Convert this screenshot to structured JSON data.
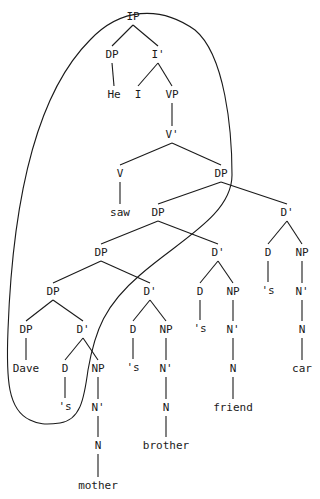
{
  "diagram": {
    "type": "syntax-tree",
    "nodes": [
      {
        "id": "n0",
        "label": "IP",
        "x": 133,
        "y": 20
      },
      {
        "id": "n1",
        "label": "DP",
        "x": 112,
        "y": 58
      },
      {
        "id": "n2",
        "label": "I'",
        "x": 158,
        "y": 58
      },
      {
        "id": "n3",
        "label": "He",
        "x": 114,
        "y": 98
      },
      {
        "id": "n4",
        "label": "I",
        "x": 138,
        "y": 98
      },
      {
        "id": "n5",
        "label": "VP",
        "x": 172,
        "y": 98
      },
      {
        "id": "n6",
        "label": "V'",
        "x": 172,
        "y": 138
      },
      {
        "id": "n7",
        "label": "V",
        "x": 120,
        "y": 177
      },
      {
        "id": "n8",
        "label": "DP",
        "x": 221,
        "y": 177
      },
      {
        "id": "n9",
        "label": "saw",
        "x": 120,
        "y": 216
      },
      {
        "id": "n10",
        "label": "DP",
        "x": 158,
        "y": 216
      },
      {
        "id": "n11",
        "label": "D'",
        "x": 287,
        "y": 216
      },
      {
        "id": "n12",
        "label": "DP",
        "x": 101,
        "y": 256
      },
      {
        "id": "n13",
        "label": "D'",
        "x": 218,
        "y": 256
      },
      {
        "id": "n14",
        "label": "D",
        "x": 268,
        "y": 256
      },
      {
        "id": "n15",
        "label": "NP",
        "x": 302,
        "y": 256
      },
      {
        "id": "n16",
        "label": "DP",
        "x": 53,
        "y": 295
      },
      {
        "id": "n17",
        "label": "D'",
        "x": 150,
        "y": 295
      },
      {
        "id": "n18",
        "label": "D",
        "x": 200,
        "y": 295
      },
      {
        "id": "n19",
        "label": "NP",
        "x": 233,
        "y": 295
      },
      {
        "id": "n20",
        "label": "'s",
        "x": 268,
        "y": 294
      },
      {
        "id": "n21",
        "label": "N'",
        "x": 302,
        "y": 295
      },
      {
        "id": "n22",
        "label": "DP",
        "x": 26,
        "y": 333
      },
      {
        "id": "n23",
        "label": "D'",
        "x": 83,
        "y": 333
      },
      {
        "id": "n24",
        "label": "D",
        "x": 133,
        "y": 333
      },
      {
        "id": "n25",
        "label": "NP",
        "x": 166,
        "y": 333
      },
      {
        "id": "n26",
        "label": "'s",
        "x": 200,
        "y": 332
      },
      {
        "id": "n27",
        "label": "N'",
        "x": 233,
        "y": 333
      },
      {
        "id": "n28",
        "label": "N",
        "x": 302,
        "y": 333
      },
      {
        "id": "n29",
        "label": "Dave",
        "x": 26,
        "y": 372
      },
      {
        "id": "n30",
        "label": "D",
        "x": 65,
        "y": 372
      },
      {
        "id": "n31",
        "label": "NP",
        "x": 98,
        "y": 372
      },
      {
        "id": "n32",
        "label": "'s",
        "x": 133,
        "y": 371
      },
      {
        "id": "n33",
        "label": "N'",
        "x": 166,
        "y": 372
      },
      {
        "id": "n34",
        "label": "N",
        "x": 233,
        "y": 372
      },
      {
        "id": "n35",
        "label": "car",
        "x": 302,
        "y": 372
      },
      {
        "id": "n36",
        "label": "'s",
        "x": 65,
        "y": 410
      },
      {
        "id": "n37",
        "label": "N'",
        "x": 98,
        "y": 411
      },
      {
        "id": "n38",
        "label": "N",
        "x": 166,
        "y": 411
      },
      {
        "id": "n39",
        "label": "friend",
        "x": 233,
        "y": 411
      },
      {
        "id": "n40",
        "label": "N",
        "x": 98,
        "y": 449
      },
      {
        "id": "n41",
        "label": "brother",
        "x": 166,
        "y": 449
      },
      {
        "id": "n42",
        "label": "mother",
        "x": 98,
        "y": 489
      }
    ],
    "edges": [
      [
        "n0",
        "n1"
      ],
      [
        "n0",
        "n2"
      ],
      [
        "n1",
        "n3"
      ],
      [
        "n2",
        "n4"
      ],
      [
        "n2",
        "n5"
      ],
      [
        "n5",
        "n6"
      ],
      [
        "n6",
        "n7"
      ],
      [
        "n6",
        "n8"
      ],
      [
        "n7",
        "n9"
      ],
      [
        "n8",
        "n10"
      ],
      [
        "n8",
        "n11"
      ],
      [
        "n10",
        "n12"
      ],
      [
        "n10",
        "n13"
      ],
      [
        "n11",
        "n14"
      ],
      [
        "n11",
        "n15"
      ],
      [
        "n12",
        "n16"
      ],
      [
        "n12",
        "n17"
      ],
      [
        "n13",
        "n18"
      ],
      [
        "n13",
        "n19"
      ],
      [
        "n14",
        "n20"
      ],
      [
        "n15",
        "n21"
      ],
      [
        "n16",
        "n22"
      ],
      [
        "n16",
        "n23"
      ],
      [
        "n17",
        "n24"
      ],
      [
        "n17",
        "n25"
      ],
      [
        "n18",
        "n26"
      ],
      [
        "n19",
        "n27"
      ],
      [
        "n21",
        "n28"
      ],
      [
        "n22",
        "n29"
      ],
      [
        "n23",
        "n30"
      ],
      [
        "n23",
        "n31"
      ],
      [
        "n24",
        "n32"
      ],
      [
        "n25",
        "n33"
      ],
      [
        "n27",
        "n34"
      ],
      [
        "n28",
        "n35"
      ],
      [
        "n30",
        "n36"
      ],
      [
        "n31",
        "n37"
      ],
      [
        "n33",
        "n38"
      ],
      [
        "n34",
        "n39"
      ],
      [
        "n37",
        "n40"
      ],
      [
        "n38",
        "n41"
      ],
      [
        "n40",
        "n42"
      ]
    ],
    "outline_path": "M 30 420 C 8 410, 6 380, 8 330 C 12 220, 30 100, 90 40 C 120 8, 160 5, 195 30 C 225 55, 232 130, 232 175 C 232 215, 180 240, 140 275 C 105 305, 95 330, 88 370 C 84 400, 80 420, 60 423 C 45 425, 38 424, 30 420 Z"
  }
}
